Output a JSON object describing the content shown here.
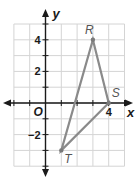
{
  "diagram": {
    "type": "coordinate-plane",
    "axes": {
      "x_label": "x",
      "y_label": "y",
      "origin_label": "O",
      "x_range": [
        -2,
        5
      ],
      "y_range": [
        -4,
        5
      ],
      "x_tick_labels": [
        {
          "value": 4,
          "text": "4"
        }
      ],
      "y_tick_labels": [
        {
          "value": 4,
          "text": "4"
        },
        {
          "value": 2,
          "text": "2"
        },
        {
          "value": -2,
          "text": "−2"
        }
      ]
    },
    "polygon": {
      "name": "triangle RST",
      "vertices": [
        {
          "label": "R",
          "x": 3,
          "y": 4
        },
        {
          "label": "S",
          "x": 4,
          "y": 0
        },
        {
          "label": "T",
          "x": 1,
          "y": -3
        }
      ],
      "color": "#8a8a8a"
    },
    "colors": {
      "grid": "#d4d4d4",
      "axes": "#1a1a1a"
    }
  }
}
